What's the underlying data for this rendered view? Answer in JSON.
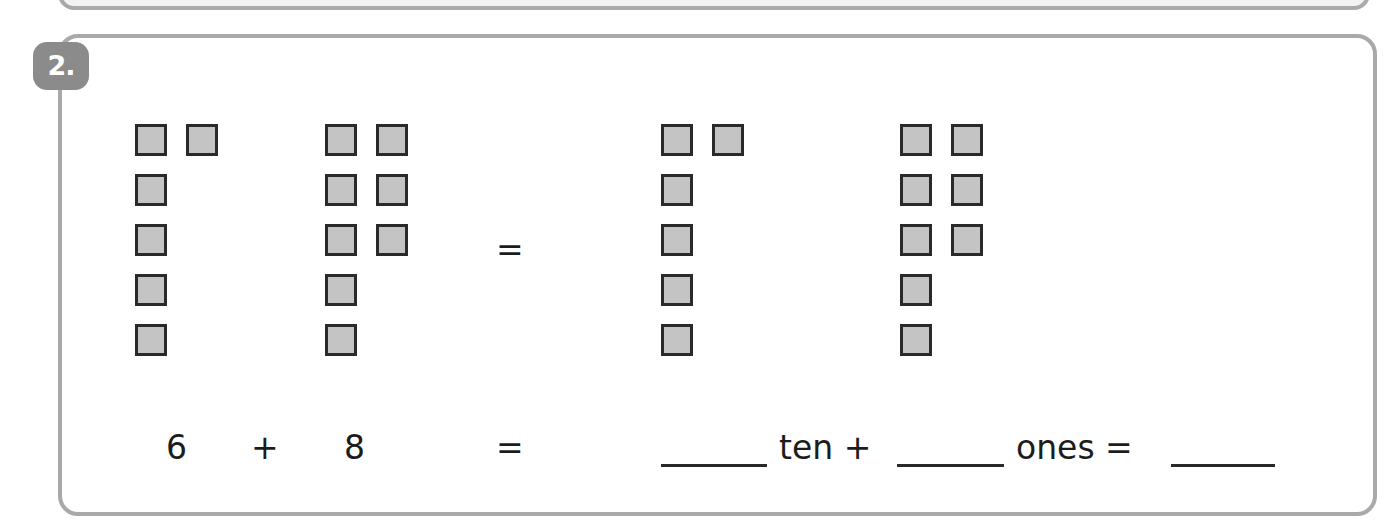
{
  "problem": {
    "number_label": "2.",
    "groups": [
      {
        "name": "group-6",
        "count": 6,
        "layout": "column of 5 + 1 extra top",
        "x": 135
      },
      {
        "name": "group-8",
        "count": 8,
        "layout": "column of 5 + 3 extra",
        "x": 325
      },
      {
        "name": "group-ten",
        "count": 6,
        "layout": "column of 5 + 1 extra top",
        "x": 661
      },
      {
        "name": "group-ones",
        "count": 8,
        "layout": "column of 5 + 3 extra",
        "x": 900
      }
    ],
    "diagram_equals": "=",
    "equation": {
      "addend1": "6",
      "plus": "+",
      "addend2": "8",
      "equals1": "=",
      "ten_label": "ten +",
      "ones_label": "ones =",
      "blank_ten": "",
      "blank_ones": "",
      "blank_total": ""
    }
  },
  "colors": {
    "border": "#a9a9a9",
    "badge": "#8b8b8b",
    "square_fill": "#c4c4c4",
    "square_border": "#2a2a2a"
  }
}
